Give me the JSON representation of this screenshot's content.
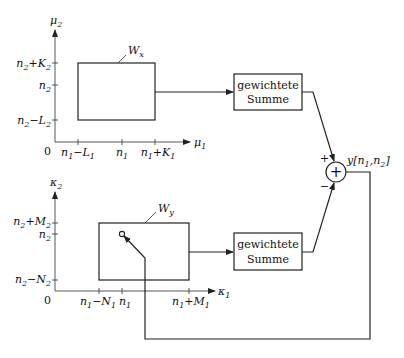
{
  "top_plot": {
    "y_axis_label": "μ",
    "y_axis_sub": "2",
    "x_axis_label": "μ",
    "x_axis_sub": "1",
    "origin": "0",
    "y_ticks": [
      {
        "main": "n",
        "sub": "2",
        "op": "+K",
        "sub2": "2"
      },
      {
        "main": "n",
        "sub": "2",
        "op": "",
        "sub2": ""
      },
      {
        "main": "n",
        "sub": "2",
        "op": "−L",
        "sub2": "2"
      }
    ],
    "x_ticks": [
      {
        "main": "n",
        "sub": "1",
        "op": "−L",
        "sub2": "1"
      },
      {
        "main": "n",
        "sub": "1",
        "op": "",
        "sub2": ""
      },
      {
        "main": "n",
        "sub": "1",
        "op": "+K",
        "sub2": "1"
      }
    ],
    "window_label": "W",
    "window_sub": "x"
  },
  "bottom_plot": {
    "y_axis_label": "κ",
    "y_axis_sub": "2",
    "x_axis_label": "κ",
    "x_axis_sub": "1",
    "origin": "0",
    "y_ticks": [
      {
        "main": "n",
        "sub": "2",
        "op": "+M",
        "sub2": "2"
      },
      {
        "main": "n",
        "sub": "2",
        "op": "",
        "sub2": ""
      },
      {
        "main": "n",
        "sub": "2",
        "op": "−N",
        "sub2": "2"
      }
    ],
    "x_ticks": [
      {
        "main": "n",
        "sub": "1",
        "op": "−N",
        "sub2": "1"
      },
      {
        "main": "n",
        "sub": "1",
        "op": "",
        "sub2": ""
      },
      {
        "main": "n",
        "sub": "1",
        "op": "+M",
        "sub2": "1"
      }
    ],
    "window_label": "W",
    "window_sub": "y"
  },
  "blocks": {
    "top_sum": {
      "line1": "gewichtete",
      "line2": "Summe"
    },
    "bottom_sum": {
      "line1": "gewichtete",
      "line2": "Summe"
    }
  },
  "adder": {
    "symbol": "+",
    "plus_sign": "+",
    "minus_sign": "−"
  },
  "output": {
    "label": "y",
    "args": "[n",
    "sub1": "1",
    "mid": ",n",
    "sub2": "2",
    "end": "]"
  }
}
